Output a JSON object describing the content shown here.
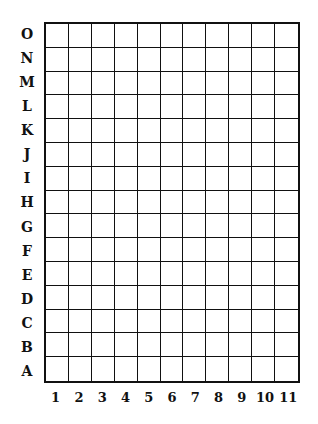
{
  "grid": {
    "columns": 11,
    "rows": 15,
    "row_labels": [
      "O",
      "N",
      "M",
      "L",
      "K",
      "J",
      "I",
      "H",
      "G",
      "F",
      "E",
      "D",
      "C",
      "B",
      "A"
    ],
    "col_labels": [
      "1",
      "2",
      "3",
      "4",
      "5",
      "6",
      "7",
      "8",
      "9",
      "10",
      "11"
    ],
    "line_color": "#111111",
    "background": "#ffffff"
  }
}
